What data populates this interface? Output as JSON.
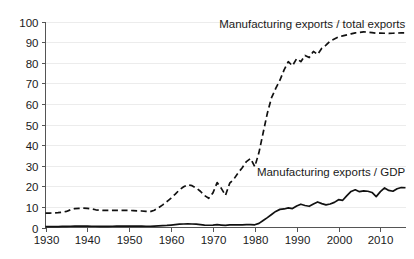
{
  "chart_data": {
    "type": "line",
    "title": "",
    "subtitle": "",
    "xlabel": "",
    "ylabel": "",
    "xlim": [
      1930,
      2016
    ],
    "ylim": [
      0,
      100
    ],
    "grid": true,
    "legend_position": "inline-annotation",
    "x_ticks": [
      "1930",
      "1940",
      "1950",
      "1960",
      "1970",
      "1980",
      "1990",
      "2000",
      "2010"
    ],
    "x_tick_values": [
      1930,
      1940,
      1950,
      1960,
      1970,
      1980,
      1990,
      2000,
      2010
    ],
    "y_ticks": [
      "0",
      "10",
      "20",
      "30",
      "40",
      "50",
      "60",
      "70",
      "80",
      "90",
      "100"
    ],
    "y_tick_values": [
      0,
      10,
      20,
      30,
      40,
      50,
      60,
      70,
      80,
      90,
      100
    ],
    "series": [
      {
        "name": "Manufacturing exports / total exports",
        "style": "dashed",
        "color": "#111111",
        "annotation": "Manufacturing exports / total exports",
        "annotation_x": 1988,
        "annotation_y": 97,
        "x": [
          1930,
          1931,
          1932,
          1933,
          1934,
          1935,
          1936,
          1937,
          1938,
          1939,
          1940,
          1941,
          1942,
          1943,
          1944,
          1945,
          1946,
          1947,
          1948,
          1949,
          1950,
          1951,
          1952,
          1953,
          1954,
          1955,
          1956,
          1957,
          1958,
          1959,
          1960,
          1961,
          1962,
          1963,
          1964,
          1965,
          1966,
          1967,
          1968,
          1969,
          1970,
          1971,
          1972,
          1973,
          1974,
          1975,
          1976,
          1977,
          1978,
          1979,
          1980,
          1981,
          1982,
          1983,
          1984,
          1985,
          1986,
          1987,
          1988,
          1989,
          1990,
          1991,
          1992,
          1993,
          1994,
          1995,
          1996,
          1997,
          1998,
          1999,
          2000,
          2001,
          2002,
          2003,
          2004,
          2005,
          2006,
          2007,
          2008,
          2009,
          2010,
          2011,
          2012,
          2013,
          2014,
          2015,
          2016
        ],
        "y": [
          7.0,
          7.0,
          7.1,
          7.2,
          7.4,
          7.8,
          8.6,
          9.2,
          9.3,
          9.4,
          9.3,
          9.0,
          8.6,
          8.4,
          8.3,
          8.3,
          8.3,
          8.3,
          8.3,
          8.3,
          8.3,
          8.2,
          8.1,
          8.0,
          7.8,
          7.7,
          8.4,
          9.6,
          11.0,
          12.6,
          14.3,
          16.2,
          18.3,
          19.8,
          20.8,
          20.3,
          19.2,
          17.6,
          15.5,
          14.2,
          16.8,
          21.8,
          19.0,
          15.6,
          21.5,
          23.5,
          26.5,
          29.0,
          32.0,
          33.5,
          29.5,
          36.5,
          46.0,
          55.5,
          63.0,
          67.5,
          71.5,
          76.5,
          80.5,
          78.5,
          82.0,
          80.5,
          83.5,
          82.5,
          85.5,
          84.0,
          87.0,
          88.5,
          90.5,
          91.5,
          92.5,
          93.0,
          93.5,
          94.0,
          94.5,
          94.7,
          95.0,
          94.8,
          94.6,
          94.3,
          94.4,
          94.3,
          94.2,
          94.3,
          94.4,
          94.5,
          94.5
        ]
      },
      {
        "name": "Manufacturing exports / GDP",
        "style": "solid",
        "color": "#111111",
        "annotation": "Manufacturing exports / GDP",
        "annotation_x": 1988,
        "annotation_y": 25,
        "x": [
          1930,
          1931,
          1932,
          1933,
          1934,
          1935,
          1936,
          1937,
          1938,
          1939,
          1940,
          1941,
          1942,
          1943,
          1944,
          1945,
          1946,
          1947,
          1948,
          1949,
          1950,
          1951,
          1952,
          1953,
          1954,
          1955,
          1956,
          1957,
          1958,
          1959,
          1960,
          1961,
          1962,
          1963,
          1964,
          1965,
          1966,
          1967,
          1968,
          1969,
          1970,
          1971,
          1972,
          1973,
          1974,
          1975,
          1976,
          1977,
          1978,
          1979,
          1980,
          1981,
          1982,
          1983,
          1984,
          1985,
          1986,
          1987,
          1988,
          1989,
          1990,
          1991,
          1992,
          1993,
          1994,
          1995,
          1996,
          1997,
          1998,
          1999,
          2000,
          2001,
          2002,
          2003,
          2004,
          2005,
          2006,
          2007,
          2008,
          2009,
          2010,
          2011,
          2012,
          2013,
          2014,
          2015,
          2016
        ],
        "y": [
          0.4,
          0.4,
          0.4,
          0.4,
          0.5,
          0.5,
          0.6,
          0.7,
          0.7,
          0.7,
          0.7,
          0.6,
          0.6,
          0.5,
          0.5,
          0.5,
          0.6,
          0.7,
          0.7,
          0.7,
          0.7,
          0.7,
          0.7,
          0.7,
          0.6,
          0.6,
          0.7,
          0.8,
          0.9,
          1.0,
          1.2,
          1.4,
          1.6,
          1.7,
          1.8,
          1.7,
          1.6,
          1.4,
          1.2,
          1.1,
          1.2,
          1.4,
          1.2,
          1.0,
          1.3,
          1.3,
          1.3,
          1.3,
          1.4,
          1.4,
          1.3,
          2.0,
          3.4,
          4.8,
          6.3,
          7.8,
          8.8,
          9.0,
          9.5,
          9.2,
          10.4,
          11.3,
          10.7,
          10.3,
          11.4,
          12.4,
          11.6,
          11.0,
          11.4,
          12.2,
          13.5,
          13.2,
          15.5,
          17.5,
          18.3,
          17.4,
          17.8,
          17.6,
          17.0,
          15.0,
          17.4,
          19.2,
          18.0,
          17.6,
          18.8,
          19.4,
          19.3
        ]
      }
    ]
  }
}
